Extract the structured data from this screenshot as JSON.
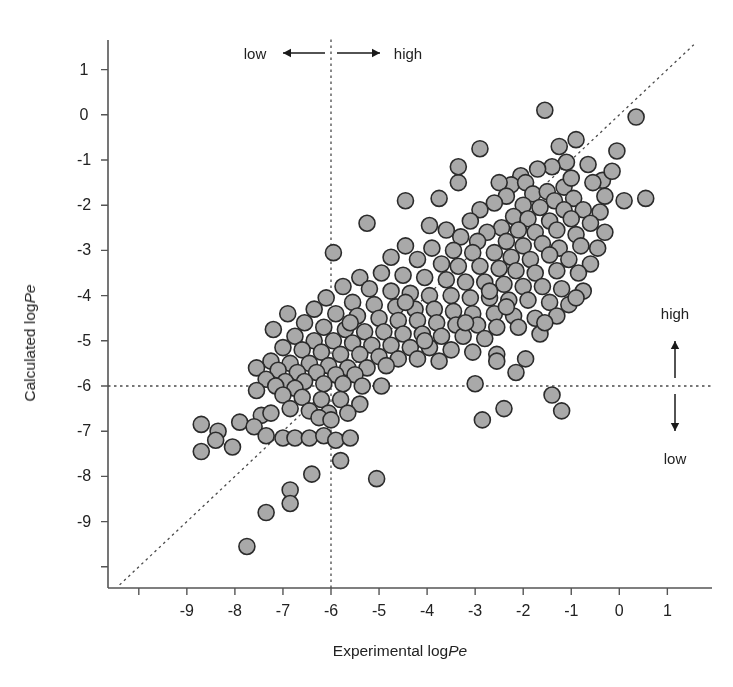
{
  "figure": {
    "type": "scatter",
    "background": "#ffffff",
    "marker_fill": "#a9a9a9",
    "marker_stroke": "#2b2b2b",
    "marker_radius": 8,
    "line_color": "#333333"
  },
  "axes": {
    "x_title_prefix": "Experimental log",
    "x_title_italic": "Pe",
    "y_title_prefix": "Calculated log",
    "y_title_italic": "Pe",
    "x_ticks": [
      -10,
      -9,
      -8,
      -7,
      -6,
      -5,
      -4,
      -3,
      -2,
      -1,
      0,
      1
    ],
    "x_tick_labels": [
      "",
      "-9",
      "-8",
      "-7",
      "-6",
      "-5",
      "-4",
      "-3",
      "-2",
      "-1",
      "0",
      "1"
    ],
    "y_ticks": [
      1,
      0,
      -1,
      -2,
      -3,
      -4,
      -5,
      -6,
      -7,
      -8,
      -9,
      -10
    ],
    "y_tick_labels": [
      "1",
      "0",
      "-1",
      "-2",
      "-3",
      "-4",
      "-5",
      "-6",
      "-7",
      "-8",
      "-9",
      ""
    ],
    "xlim": [
      -10.6,
      1.4
    ],
    "ylim": [
      -10.45,
      1.4
    ]
  },
  "annotations": {
    "top_low": "low",
    "top_high": "high",
    "right_high": "high",
    "right_low": "low",
    "threshold_x": -6,
    "threshold_y": -6
  },
  "chart_data": {
    "type": "scatter",
    "title": "",
    "xlabel": "Experimental logPe",
    "ylabel": "Calculated logPe",
    "xlim": [
      -10.6,
      1.4
    ],
    "ylim": [
      -10.45,
      1.4
    ],
    "grid": false,
    "legend": null,
    "reference_lines": [
      {
        "name": "identity",
        "type": "diagonal",
        "style": "dashed",
        "equation": "y = x"
      },
      {
        "name": "x-threshold",
        "type": "vertical",
        "style": "dashed",
        "value": -6
      },
      {
        "name": "y-threshold",
        "type": "horizontal",
        "style": "dashed",
        "value": -6
      }
    ],
    "series": [
      {
        "name": "compounds",
        "marker": "circle",
        "points": [
          [
            -1.55,
            0.1
          ],
          [
            0.35,
            -0.05
          ],
          [
            -0.9,
            -0.55
          ],
          [
            -0.05,
            -0.8
          ],
          [
            -1.25,
            -0.7
          ],
          [
            -1.1,
            -1.05
          ],
          [
            -0.65,
            -1.1
          ],
          [
            -1.4,
            -1.15
          ],
          [
            -2.9,
            -0.75
          ],
          [
            -1.7,
            -1.2
          ],
          [
            -2.05,
            -1.35
          ],
          [
            -2.25,
            -1.55
          ],
          [
            -1.95,
            -1.5
          ],
          [
            -0.35,
            -1.45
          ],
          [
            -0.55,
            -1.5
          ],
          [
            -1.15,
            -1.6
          ],
          [
            -3.35,
            -1.5
          ],
          [
            -2.5,
            -1.5
          ],
          [
            -2.35,
            -1.8
          ],
          [
            -1.8,
            -1.75
          ],
          [
            -1.5,
            -1.7
          ],
          [
            -1.35,
            -1.9
          ],
          [
            -0.95,
            -1.85
          ],
          [
            -0.3,
            -1.8
          ],
          [
            0.1,
            -1.9
          ],
          [
            -2.0,
            -2.0
          ],
          [
            -2.6,
            -1.95
          ],
          [
            -1.65,
            -2.05
          ],
          [
            -1.15,
            -2.1
          ],
          [
            -0.75,
            -2.1
          ],
          [
            -0.4,
            -2.15
          ],
          [
            -2.9,
            -2.1
          ],
          [
            -2.2,
            -2.25
          ],
          [
            -1.9,
            -2.3
          ],
          [
            -1.45,
            -2.35
          ],
          [
            -1.0,
            -2.3
          ],
          [
            -0.6,
            -2.4
          ],
          [
            -3.1,
            -2.35
          ],
          [
            -2.45,
            -2.5
          ],
          [
            -2.75,
            -2.6
          ],
          [
            -2.1,
            -2.55
          ],
          [
            -1.75,
            -2.6
          ],
          [
            -1.3,
            -2.55
          ],
          [
            -0.9,
            -2.65
          ],
          [
            -3.6,
            -2.55
          ],
          [
            -3.3,
            -2.7
          ],
          [
            -2.95,
            -2.8
          ],
          [
            -2.35,
            -2.8
          ],
          [
            -2.0,
            -2.9
          ],
          [
            -1.6,
            -2.85
          ],
          [
            -1.25,
            -2.95
          ],
          [
            -0.8,
            -2.9
          ],
          [
            -0.45,
            -2.95
          ],
          [
            -4.45,
            -2.9
          ],
          [
            -3.9,
            -2.95
          ],
          [
            -3.45,
            -3.0
          ],
          [
            -3.05,
            -3.05
          ],
          [
            -2.6,
            -3.05
          ],
          [
            -2.25,
            -3.15
          ],
          [
            -1.85,
            -3.2
          ],
          [
            -1.45,
            -3.1
          ],
          [
            -1.05,
            -3.2
          ],
          [
            -0.6,
            -3.3
          ],
          [
            -5.95,
            -3.05
          ],
          [
            -4.75,
            -3.15
          ],
          [
            -4.2,
            -3.2
          ],
          [
            -3.7,
            -3.3
          ],
          [
            -3.35,
            -3.35
          ],
          [
            -2.9,
            -3.35
          ],
          [
            -2.5,
            -3.4
          ],
          [
            -2.15,
            -3.45
          ],
          [
            -1.75,
            -3.5
          ],
          [
            -1.3,
            -3.45
          ],
          [
            -0.85,
            -3.5
          ],
          [
            -5.4,
            -3.6
          ],
          [
            -4.95,
            -3.5
          ],
          [
            -4.5,
            -3.55
          ],
          [
            -4.05,
            -3.6
          ],
          [
            -3.6,
            -3.65
          ],
          [
            -3.2,
            -3.7
          ],
          [
            -2.8,
            -3.7
          ],
          [
            -2.4,
            -3.75
          ],
          [
            -2.0,
            -3.8
          ],
          [
            -1.6,
            -3.8
          ],
          [
            -1.2,
            -3.85
          ],
          [
            -0.75,
            -3.9
          ],
          [
            -5.75,
            -3.8
          ],
          [
            -5.2,
            -3.85
          ],
          [
            -4.75,
            -3.9
          ],
          [
            -4.35,
            -3.95
          ],
          [
            -3.95,
            -4.0
          ],
          [
            -3.5,
            -4.0
          ],
          [
            -3.1,
            -4.05
          ],
          [
            -2.7,
            -4.05
          ],
          [
            -2.3,
            -4.1
          ],
          [
            -1.9,
            -4.1
          ],
          [
            -1.45,
            -4.15
          ],
          [
            -1.05,
            -4.2
          ],
          [
            -6.1,
            -4.05
          ],
          [
            -5.55,
            -4.15
          ],
          [
            -5.1,
            -4.2
          ],
          [
            -4.65,
            -4.25
          ],
          [
            -4.25,
            -4.3
          ],
          [
            -3.85,
            -4.3
          ],
          [
            -3.45,
            -4.35
          ],
          [
            -3.05,
            -4.4
          ],
          [
            -2.6,
            -4.4
          ],
          [
            -2.2,
            -4.45
          ],
          [
            -1.75,
            -4.5
          ],
          [
            -1.3,
            -4.45
          ],
          [
            -6.35,
            -4.3
          ],
          [
            -5.9,
            -4.4
          ],
          [
            -5.45,
            -4.45
          ],
          [
            -5.0,
            -4.5
          ],
          [
            -4.6,
            -4.55
          ],
          [
            -4.2,
            -4.55
          ],
          [
            -3.8,
            -4.6
          ],
          [
            -3.4,
            -4.65
          ],
          [
            -2.95,
            -4.65
          ],
          [
            -2.55,
            -4.7
          ],
          [
            -2.1,
            -4.7
          ],
          [
            -6.55,
            -4.6
          ],
          [
            -6.15,
            -4.7
          ],
          [
            -5.7,
            -4.75
          ],
          [
            -5.3,
            -4.8
          ],
          [
            -4.9,
            -4.8
          ],
          [
            -4.5,
            -4.85
          ],
          [
            -4.1,
            -4.85
          ],
          [
            -3.7,
            -4.9
          ],
          [
            -3.25,
            -4.9
          ],
          [
            -2.8,
            -4.95
          ],
          [
            -1.65,
            -4.85
          ],
          [
            -6.75,
            -4.9
          ],
          [
            -6.35,
            -5.0
          ],
          [
            -5.95,
            -5.0
          ],
          [
            -5.55,
            -5.05
          ],
          [
            -5.15,
            -5.1
          ],
          [
            -4.75,
            -5.1
          ],
          [
            -4.35,
            -5.15
          ],
          [
            -3.95,
            -5.15
          ],
          [
            -3.5,
            -5.2
          ],
          [
            -3.05,
            -5.25
          ],
          [
            -2.55,
            -5.3
          ],
          [
            -7.0,
            -5.15
          ],
          [
            -6.6,
            -5.2
          ],
          [
            -6.2,
            -5.25
          ],
          [
            -5.8,
            -5.3
          ],
          [
            -5.4,
            -5.3
          ],
          [
            -5.0,
            -5.35
          ],
          [
            -4.6,
            -5.4
          ],
          [
            -4.2,
            -5.4
          ],
          [
            -3.75,
            -5.45
          ],
          [
            -4.85,
            -5.55
          ],
          [
            -2.55,
            -5.45
          ],
          [
            -7.25,
            -5.45
          ],
          [
            -6.85,
            -5.5
          ],
          [
            -6.45,
            -5.5
          ],
          [
            -6.05,
            -5.55
          ],
          [
            -5.65,
            -5.6
          ],
          [
            -5.25,
            -5.6
          ],
          [
            -7.55,
            -5.6
          ],
          [
            -7.1,
            -5.65
          ],
          [
            -6.7,
            -5.7
          ],
          [
            -6.3,
            -5.7
          ],
          [
            -5.9,
            -5.75
          ],
          [
            -5.5,
            -5.75
          ],
          [
            -2.15,
            -5.7
          ],
          [
            -7.35,
            -5.85
          ],
          [
            -6.95,
            -5.9
          ],
          [
            -6.55,
            -5.9
          ],
          [
            -6.15,
            -5.95
          ],
          [
            -5.75,
            -5.95
          ],
          [
            -5.35,
            -6.0
          ],
          [
            -7.15,
            -6.0
          ],
          [
            -6.75,
            -6.05
          ],
          [
            -4.95,
            -6.0
          ],
          [
            -3.0,
            -5.95
          ],
          [
            -7.55,
            -6.1
          ],
          [
            -7.0,
            -6.2
          ],
          [
            -6.6,
            -6.25
          ],
          [
            -6.2,
            -6.3
          ],
          [
            -5.8,
            -6.3
          ],
          [
            -5.4,
            -6.4
          ],
          [
            -1.4,
            -6.2
          ],
          [
            -1.2,
            -6.55
          ],
          [
            -6.85,
            -6.5
          ],
          [
            -6.45,
            -6.55
          ],
          [
            -6.05,
            -6.6
          ],
          [
            -5.65,
            -6.6
          ],
          [
            -2.4,
            -6.5
          ],
          [
            -7.45,
            -6.65
          ],
          [
            -7.25,
            -6.6
          ],
          [
            -6.25,
            -6.7
          ],
          [
            -6.0,
            -6.75
          ],
          [
            -7.9,
            -6.8
          ],
          [
            -7.6,
            -6.9
          ],
          [
            -7.35,
            -7.1
          ],
          [
            -7.0,
            -7.15
          ],
          [
            -6.75,
            -7.15
          ],
          [
            -6.45,
            -7.15
          ],
          [
            -6.15,
            -7.1
          ],
          [
            -5.9,
            -7.2
          ],
          [
            -5.6,
            -7.15
          ],
          [
            -2.85,
            -6.75
          ],
          [
            -8.7,
            -6.85
          ],
          [
            -8.35,
            -7.0
          ],
          [
            -8.4,
            -7.2
          ],
          [
            -8.05,
            -7.35
          ],
          [
            -8.7,
            -7.45
          ],
          [
            -5.8,
            -7.65
          ],
          [
            -6.4,
            -7.95
          ],
          [
            -5.05,
            -8.05
          ],
          [
            -6.85,
            -8.3
          ],
          [
            -6.85,
            -8.6
          ],
          [
            -7.35,
            -8.8
          ],
          [
            -7.75,
            -9.55
          ],
          [
            -3.35,
            -1.15
          ],
          [
            -3.75,
            -1.85
          ],
          [
            -4.45,
            -1.9
          ],
          [
            -3.95,
            -2.45
          ],
          [
            -5.25,
            -2.4
          ],
          [
            -0.15,
            -1.25
          ],
          [
            0.55,
            -1.85
          ],
          [
            -0.3,
            -2.6
          ],
          [
            -1.0,
            -1.4
          ],
          [
            -2.7,
            -3.9
          ],
          [
            -3.2,
            -4.6
          ],
          [
            -2.35,
            -4.25
          ],
          [
            -1.95,
            -5.4
          ],
          [
            -0.9,
            -4.05
          ],
          [
            -1.55,
            -4.6
          ],
          [
            -6.9,
            -4.4
          ],
          [
            -7.2,
            -4.75
          ],
          [
            -4.05,
            -5.0
          ],
          [
            -4.45,
            -4.15
          ],
          [
            -5.6,
            -4.6
          ]
        ]
      }
    ]
  }
}
